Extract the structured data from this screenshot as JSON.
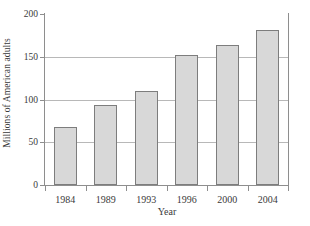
{
  "chart_data": {
    "type": "bar",
    "title": "",
    "xlabel": "Year",
    "ylabel": "Millions of American adults",
    "categories": [
      "1984",
      "1989",
      "1993",
      "1996",
      "2000",
      "2004"
    ],
    "values": [
      68,
      94,
      110,
      152,
      164,
      181
    ],
    "ylim": [
      0,
      200
    ],
    "yticks": [
      0,
      50,
      100,
      150,
      200
    ],
    "ytick_labels": [
      "0",
      "50",
      "100",
      "150",
      "200"
    ],
    "grid": "horizontal",
    "legend": "none",
    "bar_fill_color": "#d8d8d8",
    "bar_border_color": "#7d7d7d",
    "gridline_color": "#b8b8b8",
    "axis_color": "#8e8e8e"
  }
}
